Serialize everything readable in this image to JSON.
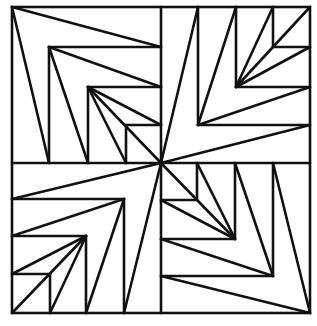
{
  "diagram": {
    "stroke_color": "#111111",
    "background_color": "#ffffff",
    "stroke_width": 2.6,
    "outer_square": {
      "x1": 12,
      "y1": 7,
      "x2": 310,
      "y2": 313
    },
    "center": [
      161,
      163
    ],
    "quadrants": {
      "top_left": {
        "apex_chain": [
          [
            12,
            7
          ],
          [
            49,
            47
          ],
          [
            88,
            87
          ],
          [
            126,
            125
          ],
          [
            161,
            163
          ]
        ],
        "segments": [
          [
            12,
            7,
            161,
            47
          ],
          [
            12,
            7,
            49,
            163
          ],
          [
            49,
            47,
            161,
            47
          ],
          [
            49,
            47,
            49,
            163
          ],
          [
            49,
            47,
            161,
            87
          ],
          [
            49,
            47,
            88,
            163
          ],
          [
            88,
            87,
            161,
            87
          ],
          [
            88,
            87,
            88,
            163
          ],
          [
            88,
            87,
            161,
            125
          ],
          [
            88,
            87,
            126,
            163
          ],
          [
            126,
            125,
            161,
            125
          ],
          [
            126,
            125,
            126,
            163
          ],
          [
            88,
            87,
            161,
            163
          ]
        ]
      },
      "top_right": {
        "apex_chain": [
          [
            161,
            163
          ],
          [
            198,
            125
          ],
          [
            236,
            87
          ],
          [
            273,
            47
          ],
          [
            310,
            7
          ]
        ],
        "segments": [
          [
            161,
            163,
            198,
            7
          ],
          [
            161,
            163,
            310,
            125
          ],
          [
            198,
            125,
            198,
            7
          ],
          [
            198,
            125,
            310,
            125
          ],
          [
            198,
            125,
            236,
            7
          ],
          [
            198,
            125,
            310,
            87
          ],
          [
            236,
            87,
            236,
            7
          ],
          [
            236,
            87,
            310,
            87
          ],
          [
            236,
            87,
            273,
            7
          ],
          [
            236,
            87,
            310,
            47
          ],
          [
            273,
            47,
            273,
            7
          ],
          [
            273,
            47,
            310,
            47
          ],
          [
            236,
            87,
            310,
            7
          ]
        ]
      },
      "bottom_left": {
        "apex_chain": [
          [
            161,
            163
          ],
          [
            124,
            199
          ],
          [
            86,
            236
          ],
          [
            50,
            274
          ],
          [
            12,
            313
          ]
        ],
        "segments": [
          [
            161,
            163,
            12,
            199
          ],
          [
            161,
            163,
            124,
            313
          ],
          [
            124,
            199,
            12,
            199
          ],
          [
            124,
            199,
            124,
            313
          ],
          [
            124,
            199,
            12,
            236
          ],
          [
            124,
            199,
            86,
            313
          ],
          [
            86,
            236,
            12,
            236
          ],
          [
            86,
            236,
            86,
            313
          ],
          [
            86,
            236,
            12,
            274
          ],
          [
            86,
            236,
            50,
            313
          ],
          [
            50,
            274,
            12,
            274
          ],
          [
            50,
            274,
            50,
            313
          ],
          [
            86,
            236,
            12,
            313
          ]
        ]
      },
      "bottom_right": {
        "apex_chain": [
          [
            161,
            163
          ],
          [
            197,
            200
          ],
          [
            235,
            239
          ],
          [
            273,
            276
          ],
          [
            310,
            313
          ]
        ],
        "segments": [
          [
            161,
            163,
            235,
            239
          ],
          [
            197,
            200,
            197,
            163
          ],
          [
            197,
            200,
            161,
            200
          ],
          [
            235,
            239,
            235,
            163
          ],
          [
            235,
            239,
            161,
            239
          ],
          [
            235,
            239,
            197,
            163
          ],
          [
            235,
            239,
            161,
            200
          ],
          [
            273,
            276,
            273,
            163
          ],
          [
            273,
            276,
            161,
            276
          ],
          [
            273,
            276,
            235,
            163
          ],
          [
            273,
            276,
            161,
            239
          ],
          [
            310,
            313,
            273,
            163
          ],
          [
            310,
            313,
            161,
            276
          ]
        ]
      }
    },
    "dividers": [
      [
        161,
        7,
        161,
        313
      ],
      [
        12,
        163,
        310,
        163
      ]
    ]
  },
  "caption": {
    "visible": "cropped",
    "fragment_widths": [
      10,
      12,
      14,
      12,
      12,
      10,
      4
    ]
  }
}
